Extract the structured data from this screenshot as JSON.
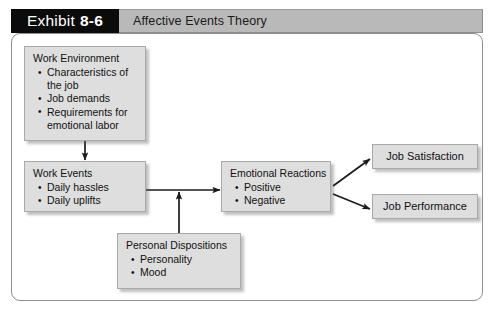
{
  "header": {
    "exhibit_label": "Exhibit",
    "exhibit_number": "8-6",
    "title": "Affective Events Theory"
  },
  "diagram": {
    "nodes": {
      "work_environment": {
        "title": "Work Environment",
        "bullets": [
          "Characteristics of\nthe job",
          "Job demands",
          "Requirements for\nemotional labor"
        ]
      },
      "work_events": {
        "title": "Work Events",
        "bullets": [
          "Daily hassles",
          "Daily uplifts"
        ]
      },
      "personal_dispositions": {
        "title": "Personal Dispositions",
        "bullets": [
          "Personality",
          "Mood"
        ]
      },
      "emotional_reactions": {
        "title": "Emotional Reactions",
        "bullets": [
          "Positive",
          "Negative"
        ]
      },
      "job_satisfaction": {
        "title": "Job Satisfaction"
      },
      "job_performance": {
        "title": "Job Performance"
      }
    },
    "connections": [
      {
        "from": "work_environment",
        "to": "work_events",
        "direction": "down"
      },
      {
        "from": "work_events",
        "to": "emotional_reactions",
        "direction": "right"
      },
      {
        "from": "personal_dispositions",
        "to": "work_events_arrow",
        "direction": "up"
      },
      {
        "from": "emotional_reactions",
        "to": "job_satisfaction",
        "direction": "up-right"
      },
      {
        "from": "emotional_reactions",
        "to": "job_performance",
        "direction": "down-right"
      }
    ]
  },
  "colors": {
    "tab_background": "#0b0b0b",
    "title_background": "#b9b9b9",
    "node_fill": "#dedede",
    "node_border": "#a9a9a9",
    "frame_border": "#8f8f8f",
    "arrow": "#1a1a1a"
  }
}
